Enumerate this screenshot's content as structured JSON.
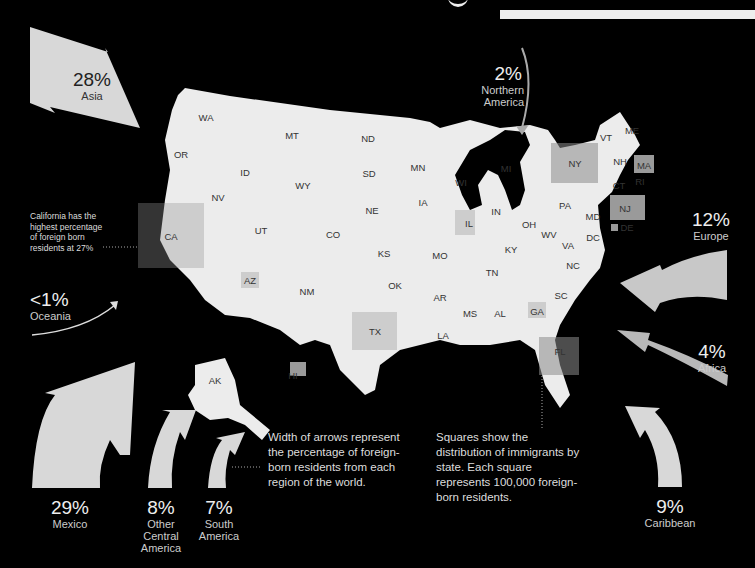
{
  "title_fragment": "g",
  "regions": [
    {
      "id": "asia",
      "percent": "28%",
      "name": "Asia"
    },
    {
      "id": "northern-america",
      "percent": "2%",
      "name": "Northern America"
    },
    {
      "id": "europe",
      "percent": "12%",
      "name": "Europe"
    },
    {
      "id": "africa",
      "percent": "4%",
      "name": "Africa"
    },
    {
      "id": "oceania",
      "percent": "<1%",
      "name": "Oceania"
    },
    {
      "id": "mexico",
      "percent": "29%",
      "name": "Mexico"
    },
    {
      "id": "other-central-america",
      "percent": "8%",
      "name": "Other Central America"
    },
    {
      "id": "south-america",
      "percent": "7%",
      "name": "South America"
    },
    {
      "id": "caribbean",
      "percent": "9%",
      "name": "Caribbean"
    }
  ],
  "notes": {
    "california": "California has the highest percentage of foreign born residents at 27%",
    "arrows": "Width of arrows represent the percentage of foreign-born residents from each region of the world.",
    "squares": "Squares show the distribution of immigrants by state. Each square represents 100,000 foreign-born residents."
  },
  "states": [
    "WA",
    "OR",
    "CA",
    "NV",
    "ID",
    "MT",
    "WY",
    "UT",
    "AZ",
    "NM",
    "CO",
    "ND",
    "SD",
    "NE",
    "KS",
    "OK",
    "TX",
    "MN",
    "IA",
    "MO",
    "AR",
    "LA",
    "WI",
    "IL",
    "MI",
    "IN",
    "OH",
    "KY",
    "TN",
    "MS",
    "AL",
    "GA",
    "FL",
    "SC",
    "NC",
    "VA",
    "WV",
    "PA",
    "NY",
    "VT",
    "NH",
    "ME",
    "MA",
    "RI",
    "CT",
    "NJ",
    "DE",
    "MD",
    "DC",
    "AK",
    "HI"
  ],
  "colors": {
    "background": "#000000",
    "map": "#ececec",
    "arrow": "#d8d8d8",
    "highlight_state": "#9a9a9a"
  }
}
